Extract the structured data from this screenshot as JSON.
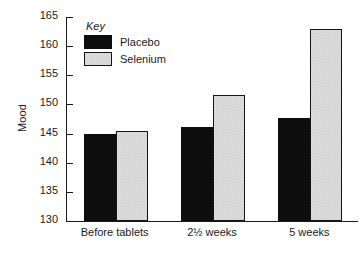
{
  "chart_data": {
    "type": "bar",
    "title": "",
    "xlabel": "",
    "ylabel": "Mood",
    "categories": [
      "Before tablets",
      "2½ weeks",
      "5 weeks"
    ],
    "series": [
      {
        "name": "Placebo",
        "color": "#0d0d0d",
        "values": [
          145.0,
          146.1,
          147.7
        ]
      },
      {
        "name": "Selenium",
        "color": "#dfdfdf",
        "values": [
          145.5,
          151.7,
          163.0
        ]
      }
    ],
    "ylim": [
      130,
      165
    ],
    "yticks": [
      130,
      135,
      140,
      145,
      150,
      155,
      160,
      165
    ],
    "grid": false,
    "legend": {
      "title": "Key",
      "position": "top-left"
    }
  },
  "legend": {
    "title": "Key",
    "entries": [
      {
        "label": "Placebo"
      },
      {
        "label": "Selenium"
      }
    ]
  }
}
